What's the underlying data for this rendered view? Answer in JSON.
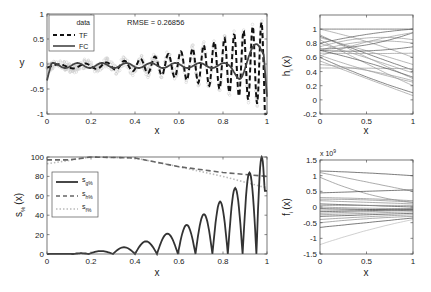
{
  "chart_data": [
    {
      "id": "fit",
      "type": "line",
      "xlabel": "x",
      "ylabel": "y",
      "xlim": [
        0,
        1
      ],
      "ylim": [
        -1,
        1
      ],
      "xticks": [
        "0",
        "0.2",
        "0.4",
        "0.6",
        "0.8",
        "1"
      ],
      "yticks": [
        "-1",
        "-0.5",
        "0",
        "0.5",
        "1"
      ],
      "annotation": "RMSE = 0.26856",
      "legend": [
        "data",
        "TF",
        "FC"
      ],
      "series": [
        {
          "name": "data",
          "style": "gray markers",
          "description": "noisy samples around TF"
        },
        {
          "name": "TF",
          "style": "dashed black",
          "description": "growing oscillation, peaks ~0.2@0.5, 0.4@0.67, 0.6@0.82, 0.85@0.95; troughs ~-0.4@0.6, -0.65@0.75, -0.85@0.89"
        },
        {
          "name": "FC",
          "style": "solid dark gray",
          "description": "low-amplitude oscillation near 0 rising to ~0.45 at 0.96"
        }
      ]
    },
    {
      "id": "h",
      "type": "line",
      "xlabel": "x",
      "ylabel": "h_i (x)",
      "xlim": [
        0,
        1
      ],
      "ylim": [
        -0.2,
        1.2
      ],
      "xticks": [
        "0",
        "0.5",
        "1"
      ],
      "yticks": [
        "-0.2",
        "0",
        "0.2",
        "0.4",
        "0.6",
        "0.8",
        "1"
      ],
      "series_count": 20
    },
    {
      "id": "s",
      "type": "line",
      "xlabel": "x",
      "ylabel": "s_% (x)",
      "xlim": [
        0,
        1
      ],
      "ylim": [
        0,
        100
      ],
      "xticks": [
        "0",
        "0.2",
        "0.4",
        "0.6",
        "0.8",
        "1"
      ],
      "yticks": [
        "0",
        "20",
        "40",
        "60",
        "80",
        "100"
      ],
      "legend": [
        "s_g%",
        "s_h%",
        "s_f%"
      ],
      "series": [
        {
          "name": "s_g%",
          "style": "solid dark",
          "description": "arches growing in height: ~3@0.25, 7@0.35, 13@0.45, 21@0.55, 30@0.64, 41@0.72, 54@0.79, 68@0.86, 84@0.92, 100@0.98"
        },
        {
          "name": "s_h%",
          "style": "dashed",
          "x": [
            0,
            0.1,
            0.2,
            0.4,
            0.6,
            0.8,
            1
          ],
          "values": [
            97,
            97,
            100,
            99,
            90,
            84,
            80
          ]
        },
        {
          "name": "s_f%",
          "style": "dotted light",
          "x": [
            0,
            0.2,
            0.4,
            0.6,
            0.8,
            1
          ],
          "values": [
            93,
            100,
            99,
            90,
            80,
            68
          ]
        }
      ]
    },
    {
      "id": "f",
      "type": "line",
      "xlabel": "x",
      "ylabel": "f_i (x)",
      "xlim": [
        0,
        1
      ],
      "ylim": [
        -1.5,
        1.5
      ],
      "scale_label": "x 10^9",
      "xticks": [
        "0",
        "0.5",
        "1"
      ],
      "yticks": [
        "-1.5",
        "-1",
        "-0.5",
        "0",
        "0.5",
        "1",
        "1.5"
      ],
      "series_count": 20
    }
  ],
  "labels": {
    "rmse": "RMSE = 0.26856",
    "x": "x",
    "y": "y",
    "h_main": "h",
    "h_sub": "i",
    "h_tail": "(x)",
    "s_main": "s",
    "s_sub": "%",
    "s_tail": "(x)",
    "f_main": "f",
    "f_sub": "i",
    "f_tail": "(x)",
    "scale_x": "x 10",
    "scale_exp": "9",
    "legend_data": "data",
    "legend_tf": "TF",
    "legend_fc": "FC",
    "leg_s": "s",
    "leg_g": "g%",
    "leg_h": "h%",
    "leg_f": "f%",
    "xt6": [
      "0",
      "0.2",
      "0.4",
      "0.6",
      "0.8",
      "1"
    ],
    "xt3": [
      "0",
      "0.5",
      "1"
    ],
    "yt_fit": [
      "-1",
      "-0.5",
      "0",
      "0.5",
      "1"
    ],
    "yt_h": [
      "-0.2",
      "0",
      "0.2",
      "0.4",
      "0.6",
      "0.8",
      "1"
    ],
    "yt_s": [
      "0",
      "20",
      "40",
      "60",
      "80",
      "100"
    ],
    "yt_f": [
      "-1.5",
      "-1",
      "-0.5",
      "0",
      "0.5",
      "1",
      "1.5"
    ]
  }
}
